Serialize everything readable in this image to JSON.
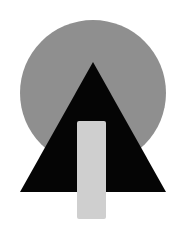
{
  "diagram": {
    "shapes": [
      {
        "type": "circle",
        "name": "gray-circle",
        "fill": "#8f8f8f"
      },
      {
        "type": "triangle",
        "name": "black-triangle",
        "fill": "#050505"
      },
      {
        "type": "rectangle",
        "name": "light-gray-bar",
        "fill": "#cfcfcf"
      }
    ],
    "background": "#ffffff"
  }
}
